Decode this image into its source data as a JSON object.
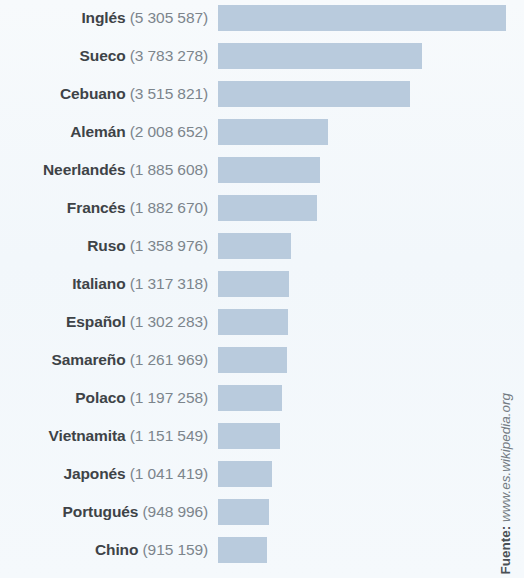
{
  "chart_data": {
    "type": "bar",
    "orientation": "horizontal",
    "title": "",
    "subtitle": "",
    "xlabel": "",
    "ylabel": "",
    "grid": false,
    "legend": null,
    "axis_visible": false,
    "tick_labels": [],
    "categories": [
      "Inglés",
      "Sueco",
      "Cebuano",
      "Alemán",
      "Neerlandés",
      "Francés",
      "Ruso",
      "Italiano",
      "Español",
      "Samareño",
      "Polaco",
      "Vietnamita",
      "Japonés",
      "Portugués",
      "Chino"
    ],
    "values": [
      5305587,
      3783278,
      3515821,
      2008652,
      1885608,
      1882670,
      1358976,
      1317318,
      1302283,
      1261969,
      1197258,
      1151549,
      1041419,
      948996,
      915159
    ],
    "value_labels": [
      "5 305 587",
      "3 783 278",
      "3 515 821",
      "2 008 652",
      "1 885 608",
      "1 882 670",
      "1 358 976",
      "1 317 318",
      "1 302 283",
      "1 261 969",
      "1 197 258",
      "1 151 549",
      "1 041 419",
      "948 996",
      "915 159"
    ],
    "bar_pixel_widths": [
      288,
      204,
      192,
      110,
      102,
      99,
      73,
      71,
      70,
      69,
      64,
      62,
      54,
      51,
      49
    ],
    "bar_color": "#b9cbdd",
    "background_color": "#f4f8fb",
    "label_name_color": "#3e4347",
    "label_value_color": "#7c858c"
  },
  "rows": [
    {
      "name": "Inglés",
      "count": "(5 305 587)"
    },
    {
      "name": "Sueco",
      "count": "(3 783 278)"
    },
    {
      "name": "Cebuano",
      "count": "(3 515 821)"
    },
    {
      "name": "Alemán",
      "count": "(2 008 652)"
    },
    {
      "name": "Neerlandés",
      "count": "(1 885 608)"
    },
    {
      "name": "Francés",
      "count": "(1 882 670)"
    },
    {
      "name": "Ruso",
      "count": "(1 358 976)"
    },
    {
      "name": "Italiano",
      "count": "(1 317 318)"
    },
    {
      "name": "Español",
      "count": "(1 302 283)"
    },
    {
      "name": "Samareño",
      "count": "(1 261 969)"
    },
    {
      "name": "Polaco",
      "count": "(1 197 258)"
    },
    {
      "name": "Vietnamita",
      "count": "(1 151 549)"
    },
    {
      "name": "Japonés",
      "count": "(1 041 419)"
    },
    {
      "name": "Portugués",
      "count": "(948 996)"
    },
    {
      "name": "Chino",
      "count": "(915 159)"
    }
  ],
  "source": {
    "label": "Fuente:",
    "url": "www.es.wikipedia.org"
  }
}
